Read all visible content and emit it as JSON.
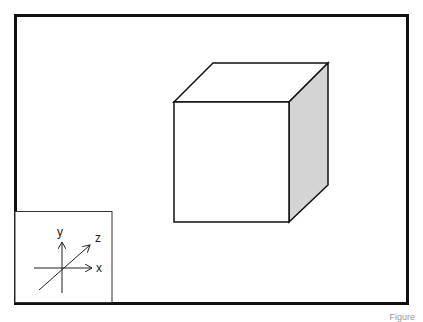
{
  "diagram": {
    "faces": {
      "front": {
        "fill": "#ffffff"
      },
      "top": {
        "fill": "#ffffff"
      },
      "right": {
        "fill": "#d4d4d4"
      }
    },
    "stroke_color": "#111111",
    "frame_color": "#111111"
  },
  "axes_inset": {
    "labels": {
      "x": "x",
      "y": "y",
      "z": "z"
    }
  },
  "caption": "Figure"
}
